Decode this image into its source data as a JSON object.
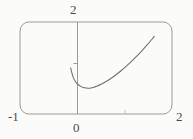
{
  "figure": {
    "title": "",
    "frame_style": "rounded-rectangle",
    "background_color": "#fbfbfa",
    "line_color": "#8c8c8c",
    "curve_color": "#6e6e6e",
    "label_color": "#4a4a4a"
  },
  "labels": {
    "y_max": "2",
    "x_min": "-1",
    "x_max": "2",
    "origin": "0"
  },
  "chart_data": {
    "type": "line",
    "title": "",
    "xlabel": "",
    "ylabel": "",
    "xlim": [
      -1,
      2
    ],
    "ylim": [
      0,
      2
    ],
    "xticks": [
      -1,
      0,
      1,
      2
    ],
    "xticklabels": [
      "-1",
      "0",
      "",
      "2"
    ],
    "yticks": [
      0,
      2
    ],
    "yticklabels": [
      "0",
      "2"
    ],
    "grid": false,
    "legend": false,
    "legend_position": "none",
    "annotations": [
      {
        "text": "2",
        "position": "top-above-axis",
        "value": 2
      },
      {
        "text": "-1",
        "position": "bottom-left-outside",
        "value": -1
      },
      {
        "text": "2",
        "position": "bottom-right-outside",
        "value": 2
      },
      {
        "text": "0",
        "position": "bottom-center-below-axis",
        "value": 0
      }
    ],
    "series": [
      {
        "name": "curve",
        "x": [
          0.0,
          0.04,
          0.08,
          0.12,
          0.16,
          0.2,
          0.25,
          0.3,
          0.35,
          0.4,
          0.45,
          0.5,
          0.6,
          0.7,
          0.8,
          0.9,
          1.0,
          1.1,
          1.2,
          1.3,
          1.4,
          1.5,
          1.6,
          1.65
        ],
        "y": [
          1.0,
          0.83,
          0.73,
          0.67,
          0.63,
          0.6,
          0.575,
          0.563,
          0.56,
          0.565,
          0.578,
          0.596,
          0.645,
          0.706,
          0.778,
          0.858,
          0.946,
          1.041,
          1.143,
          1.252,
          1.367,
          1.49,
          1.62,
          1.69
        ]
      }
    ]
  }
}
